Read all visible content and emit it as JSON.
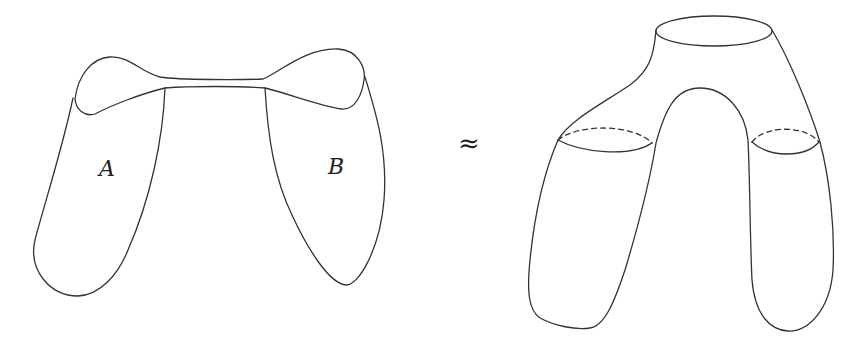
{
  "figure": {
    "left": {
      "description": "two surfaces A and B joined by a thin band",
      "labels": {
        "a": "A",
        "b": "B"
      }
    },
    "relation": {
      "symbol": "≈"
    },
    "right": {
      "description": "pair-of-pants surface with one top boundary circle and two leg cross-sections"
    },
    "colors": {
      "line": "#333333",
      "background": "#ffffff"
    }
  }
}
